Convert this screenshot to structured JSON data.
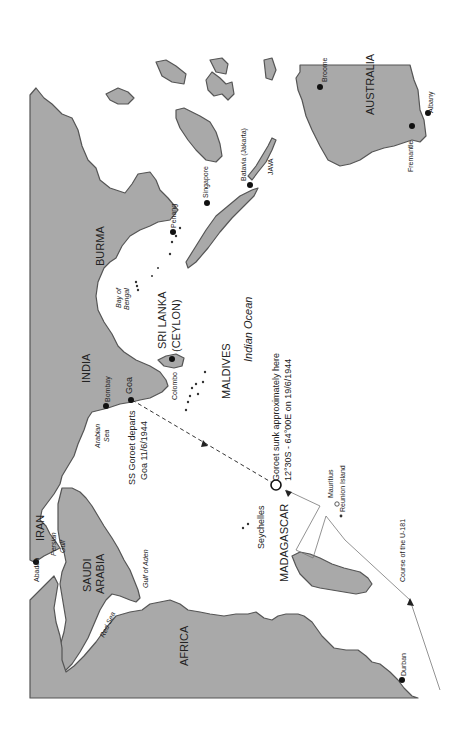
{
  "map": {
    "title": "Route of SS Goroet and U-181 in the Indian Ocean, 1944",
    "orientation": "rotated 90 degrees (north to the left)",
    "land_color": "#a9a9a9",
    "water_color": "#ffffff",
    "regions": {
      "africa": "AFRICA",
      "saudi_arabia_1": "SAUDI",
      "saudi_arabia_2": "ARABIA",
      "iran": "IRAN",
      "india": "INDIA",
      "burma": "BURMA",
      "sri_lanka_1": "SRI LANKA",
      "sri_lanka_2": "(CEYLON)",
      "maldives": "MALDIVES",
      "madagascar": "MADAGASCAR",
      "seychelles": "Seychelles",
      "java": "JAVA",
      "australia": "AUSTRALIA"
    },
    "water_bodies": {
      "red_sea": "Red Sea",
      "gulf_of_aden": "Gulf of Aden",
      "persian_gulf_1": "Persian",
      "persian_gulf_2": "Gulf",
      "arabian_sea_1": "Arabian",
      "arabian_sea_2": "Sea",
      "bay_of_bengal_1": "Bay of",
      "bay_of_bengal_2": "Bengal",
      "indian_ocean": "Indian Ocean"
    },
    "cities": {
      "abadan": "Abadan",
      "bombay": "Bombay",
      "goa": "Goa",
      "colombo": "Colombo",
      "penang": "Penang",
      "singapore": "Singapore",
      "batavia": "Batavia (Jakarta)",
      "broome": "Broome",
      "fremantle": "Fremantle",
      "albany": "Albany",
      "durban": "Durban",
      "mauritius": "Mauritius",
      "reunion": "Reunion Island"
    },
    "annotations": {
      "departure_1": "SS Goroet departs",
      "departure_2": "Goa 11/6/1944",
      "sinking_1": "Goroet sunk approximately here",
      "sinking_2": "12°30S - 64°00E on 19/6/1944",
      "u181_course": "Course of the U-181"
    }
  }
}
